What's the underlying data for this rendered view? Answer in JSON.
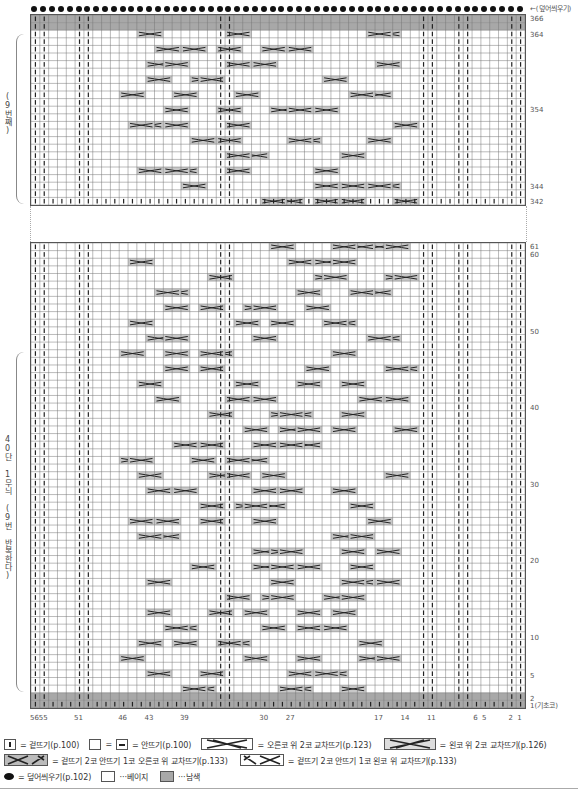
{
  "chart": {
    "top_bind_off_label": "←(덮어씌우기)",
    "top_section_side_label": "(9번째)",
    "bottom_section_side_label": "40단 1무늬 (9번 반복한다)",
    "row_labels_top": [
      "366",
      "364",
      "354",
      "344",
      "342"
    ],
    "row_labels_bottom": [
      "61",
      "60",
      "50",
      "40",
      "30",
      "20",
      "10",
      "5",
      "2",
      "1(기초코)"
    ],
    "column_labels": [
      "56",
      "55",
      "51",
      "46",
      "43",
      "39",
      "30",
      "27",
      "17",
      "14",
      "11",
      "6",
      "5",
      "2",
      "1"
    ],
    "columns": 56,
    "colors": {
      "navy_cell": "#a8a8a8",
      "beige_cell": "#ffffff",
      "cable_cell": "#c8c8c8",
      "grid_line": "#777777"
    }
  },
  "legend": {
    "knit": "= 겉뜨기(p.100)",
    "purl_eq": "=",
    "purl": "= 안뜨기(p.100)",
    "right_cross_2": "= 오른코 위 2코 교차뜨기(p.123)",
    "left_cross_2": "= 왼코 위 2코 교차뜨기(p.126)",
    "k2p1_right": "= 겉뜨기 2코 안뜨기 1코 오른코 위 교차뜨기(p.133)",
    "k2p1_left": "= 겉뜨기 2코 안뜨기 1코 왼코 위 교차뜨기(p.133)",
    "bind_off": "= 덮어씌우기(p.102)",
    "beige": "···베이지",
    "navy": "···남색"
  }
}
